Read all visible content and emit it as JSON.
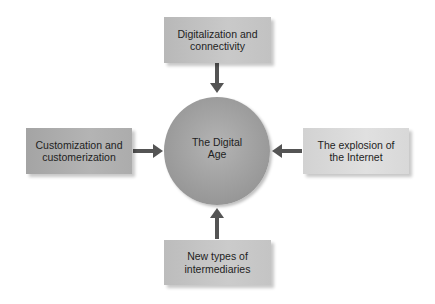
{
  "diagram": {
    "center": {
      "label_line1": "The Digital",
      "label_line2": "Age"
    },
    "nodes": {
      "top": {
        "label_line1": "Digitalization and",
        "label_line2": "connectivity"
      },
      "left": {
        "label_line1": "Customization and",
        "label_line2": "customerization"
      },
      "right": {
        "label_line1": "The explosion of",
        "label_line2": "the Internet"
      },
      "bottom": {
        "label_line1": "New types of",
        "label_line2": "intermediaries"
      }
    },
    "colors": {
      "arrow": "#545454",
      "hub": "#a2a2a2",
      "box_left": "#acacac",
      "box_top": "#c2c2c2",
      "box_right": "#d8d8d8",
      "box_bottom": "#c4c4c4"
    }
  }
}
